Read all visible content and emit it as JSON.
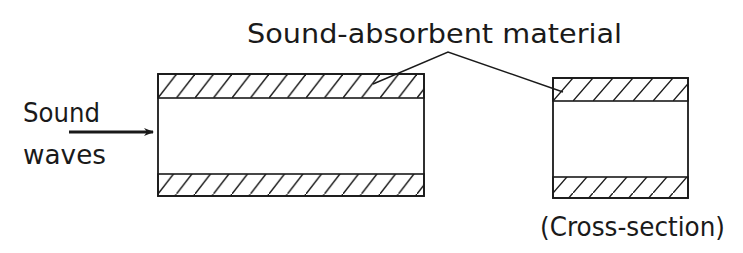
{
  "title": "Sound-absorbent material",
  "input_label": {
    "line1": "Sound",
    "line2": "waves"
  },
  "caption": "(Cross-section)",
  "colors": {
    "ink": "#1a1a1a",
    "background": "#ffffff"
  },
  "components": {
    "duct_side_view": {
      "label": "duct side view with absorbent lining"
    },
    "duct_cross_section": {
      "label": "duct cross-section with absorbent lining"
    },
    "arrow": {
      "label": "sound waves direction arrow"
    }
  }
}
